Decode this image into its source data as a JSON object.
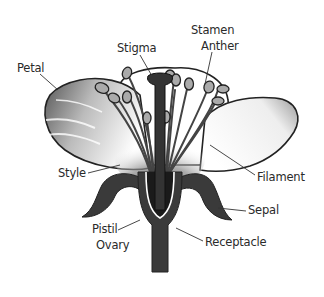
{
  "labels": {
    "petal": "Petal",
    "stigma": "Stigma",
    "stamen": "Stamen",
    "anther": "Anther",
    "style": "Style",
    "filament": "Filament",
    "sepal": "Sepal",
    "pistil": "Pistil",
    "ovary": "Ovary",
    "receptacle": "Receptacle"
  },
  "colors": {
    "outline": "#222222",
    "dark_part": "#3a3a3a",
    "label_text": "#2a2a2a",
    "background": "#ffffff"
  }
}
